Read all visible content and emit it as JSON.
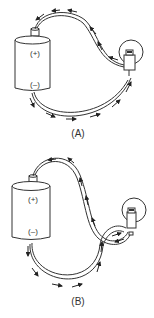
{
  "figure_a": {
    "positive_label": "(+)",
    "negative_label": "(–)",
    "caption": "(A)"
  },
  "figure_b": {
    "positive_label": "(+)",
    "negative_label": "(–)",
    "caption": "(B)"
  }
}
